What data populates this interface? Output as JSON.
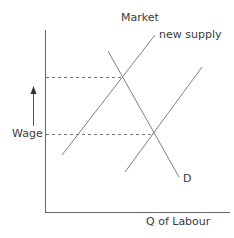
{
  "title": "Market",
  "axes": {
    "y_label": "Wage",
    "x_label": "Q of Labour"
  },
  "curves": {
    "new_supply_label": "new supply",
    "demand_label": "D"
  },
  "colors": {
    "line": "#808080",
    "axis": "#666666",
    "text": "#3a3a3a"
  }
}
